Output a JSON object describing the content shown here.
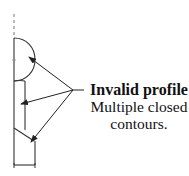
{
  "annotation": {
    "title": "Invalid profile",
    "lines": [
      "Multiple closed",
      "contours."
    ]
  },
  "colors": {
    "stroke": "#333333",
    "centerline": "#777777",
    "text": "#111111",
    "background": "#ffffff"
  },
  "sketch": {
    "centerline": {
      "x": 14,
      "y1": 14,
      "y2": 38
    },
    "outer_edge": {
      "x": 14,
      "y1": 38,
      "y2": 165
    },
    "arc": {
      "start": [
        14,
        38
      ],
      "end": [
        14,
        81
      ],
      "bulge_x": 35
    },
    "inner_edge": {
      "x": 25,
      "y1": 81,
      "y2": 130
    },
    "diagonal": {
      "from": [
        14,
        128
      ],
      "to": [
        34,
        141
      ]
    },
    "right_edge": {
      "x": 35,
      "y1": 141,
      "y2": 165
    },
    "bottom_edge": {
      "y": 165,
      "x1": 14,
      "x2": 35
    }
  },
  "callout": {
    "origin": [
      73,
      90
    ],
    "leader_end": [
      84,
      90
    ],
    "targets": [
      [
        29,
        57
      ],
      [
        21,
        104
      ],
      [
        31,
        142
      ]
    ]
  }
}
